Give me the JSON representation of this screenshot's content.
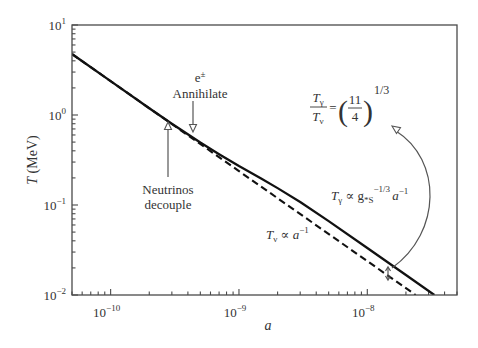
{
  "chart_data": {
    "type": "line",
    "title": "",
    "xlabel": "a",
    "ylabel_var": "T",
    "ylabel_unit": " (MeV)",
    "xscale": "log",
    "yscale": "log",
    "xlim": [
      5e-11,
      5e-08
    ],
    "ylim": [
      0.01,
      10
    ],
    "grid": false,
    "legend": "none",
    "x_ticks": [
      {
        "value": 1e-10,
        "base": "10",
        "exp": "−10"
      },
      {
        "value": 1e-09,
        "base": "10",
        "exp": "−9"
      },
      {
        "value": 1e-08,
        "base": "10",
        "exp": "−8"
      }
    ],
    "y_ticks": [
      {
        "value": 10,
        "base": "10",
        "exp": "1"
      },
      {
        "value": 1,
        "base": "10",
        "exp": "0"
      },
      {
        "value": 0.1,
        "base": "10",
        "exp": "−1"
      },
      {
        "value": 0.01,
        "base": "10",
        "exp": "−2"
      }
    ],
    "series": [
      {
        "name": "T_gamma (photon temperature)",
        "style": "solid",
        "x": [
          5e-11,
          1e-10,
          2e-10,
          3e-10,
          5e-10,
          7e-10,
          1e-09,
          1.5e-09,
          2e-09,
          3e-09,
          5e-09,
          1e-08,
          2e-08,
          3.33e-08
        ],
        "y": [
          4.76,
          2.38,
          1.19,
          0.8,
          0.495,
          0.367,
          0.271,
          0.196,
          0.154,
          0.108,
          0.0662,
          0.0333,
          0.0167,
          0.01
        ]
      },
      {
        "name": "T_nu (neutrino temperature)",
        "style": "dashed",
        "x": [
          5e-11,
          1e-10,
          1e-09,
          1e-08,
          2.38e-08
        ],
        "y": [
          4.76,
          2.38,
          0.238,
          0.0238,
          0.01
        ]
      }
    ],
    "annotations": {
      "ee_base": "e",
      "ee_sup": "±",
      "ee_label": "Annihilate",
      "nu_label_1": "Neutrinos",
      "nu_label_2": "decouple",
      "ratio_eq": {
        "num_T": "T",
        "num_sub": "γ",
        "den_T": "T",
        "den_sub": "ν",
        "equals": "=",
        "paren_open": "(",
        "frac_num": "11",
        "frac_den": "4",
        "paren_close": ")",
        "exponent": "1/3"
      },
      "tgamma_label": {
        "T": "T",
        "sub": "γ",
        "prop": " ∝ g",
        "g_sub": "*S",
        "g_exp": "−1/3",
        "a": "a",
        "a_exp": "−1"
      },
      "tnu_label": {
        "T": "T",
        "sub": "ν",
        "prop": " ∝ ",
        "a": "a",
        "a_exp": "−1"
      }
    }
  }
}
